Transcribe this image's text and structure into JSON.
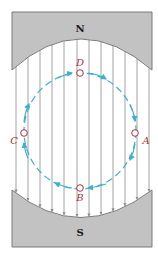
{
  "diagram": {
    "colors": {
      "magnet": "#c2c2c2",
      "magnet_edge": "#7a7a7a",
      "field_line": "#8a8a8a",
      "loop": "#3bb0d0",
      "point": "#b03040",
      "label": "#b03040",
      "pole_label": "#1a1a1a"
    },
    "poles": {
      "north": {
        "label": "N"
      },
      "south": {
        "label": "S"
      }
    },
    "points": [
      {
        "id": "D",
        "label": "D",
        "x": 80,
        "y": 73,
        "lx": 80,
        "ly": 66
      },
      {
        "id": "A",
        "label": "A",
        "x": 135,
        "y": 133,
        "lx": 146,
        "ly": 144
      },
      {
        "id": "B",
        "label": "B",
        "x": 80,
        "y": 188,
        "lx": 80,
        "ly": 201
      },
      {
        "id": "C",
        "label": "C",
        "x": 24,
        "y": 133,
        "lx": 14,
        "ly": 144
      }
    ],
    "field_lines_x": [
      16,
      28,
      40,
      52,
      64,
      77,
      89,
      101,
      113,
      125,
      137,
      149
    ],
    "loop_direction": "D -> A -> B -> C -> D"
  }
}
